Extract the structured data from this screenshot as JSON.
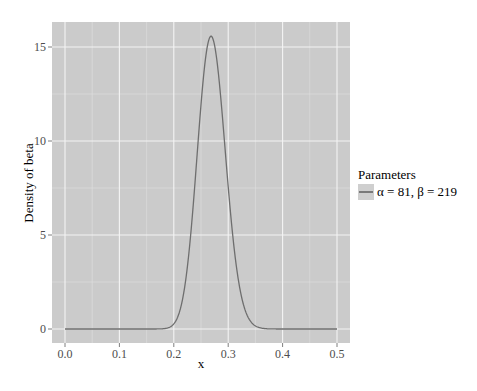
{
  "chart_data": {
    "type": "line",
    "title": "",
    "xlabel": "x",
    "ylabel": "Density of beta",
    "xlim": [
      -0.008,
      0.525
    ],
    "ylim": [
      -0.8,
      16.4
    ],
    "x_ticks": [
      0.0,
      0.1,
      0.2,
      0.3,
      0.4,
      0.5
    ],
    "x_tick_labels": [
      "0.0",
      "0.1",
      "0.2",
      "0.3",
      "0.4",
      "0.5"
    ],
    "y_ticks": [
      0,
      5,
      10,
      15
    ],
    "y_tick_labels": [
      "0",
      "5",
      "10",
      "15"
    ],
    "grid": true,
    "legend_position": "right",
    "legend_title": "Parameters",
    "series": [
      {
        "name": "α = 81, β = 219",
        "distribution": "beta",
        "alpha": 81,
        "beta": 219,
        "color": "#6e6e6e",
        "x": [
          0.0,
          0.05,
          0.1,
          0.15,
          0.18,
          0.2,
          0.21,
          0.22,
          0.23,
          0.24,
          0.25,
          0.26,
          0.27,
          0.28,
          0.29,
          0.3,
          0.31,
          0.32,
          0.33,
          0.34,
          0.35,
          0.36,
          0.38,
          0.4,
          0.45,
          0.5
        ],
        "values": [
          0,
          0,
          0,
          0,
          0.05,
          0.4,
          1.0,
          2.2,
          4.1,
          6.8,
          9.9,
          13.1,
          15.5,
          15.4,
          13.4,
          10.6,
          7.5,
          4.8,
          2.8,
          1.5,
          0.72,
          0.31,
          0.04,
          0.003,
          0,
          0
        ]
      }
    ]
  },
  "legend": {
    "title": "Parameters",
    "items": [
      {
        "label": "α = 81, β = 219"
      }
    ]
  },
  "axes": {
    "xlabel": "x",
    "ylabel": "Density of beta"
  }
}
